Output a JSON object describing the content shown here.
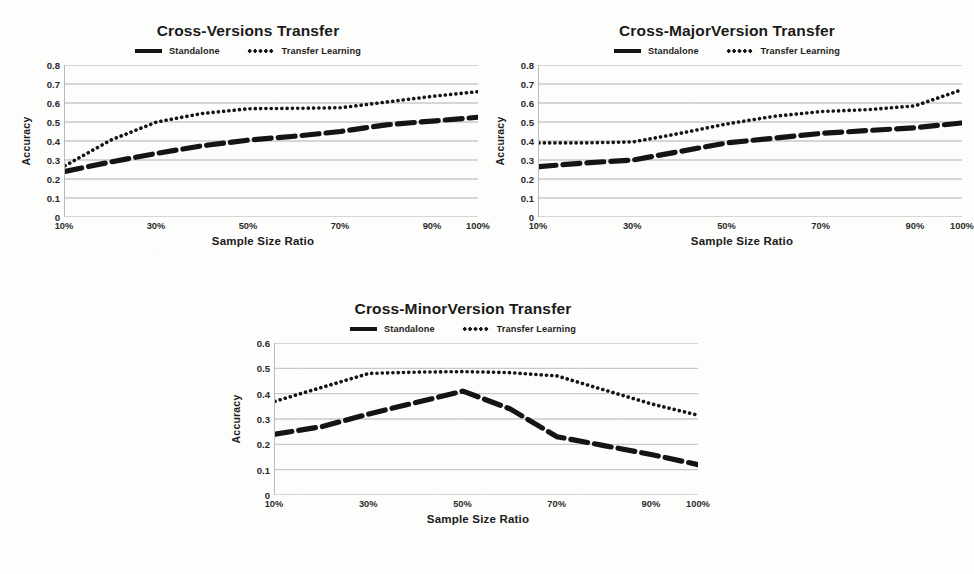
{
  "figure": {
    "background": "#fdfdfc",
    "ink": "#141414",
    "gridline_color": "#c9c9c9",
    "axis_color": "#b9b9b9"
  },
  "legend": {
    "standalone_label": "Standalone",
    "transfer_label": "Transfer Learning",
    "standalone_style": "solid-thick-line",
    "transfer_style": "dotted-line"
  },
  "axis": {
    "xlabel": "Sample Size Ratio",
    "ylabel": "Accuracy",
    "xticks": [
      "10%",
      "30%",
      "50%",
      "70%",
      "90%",
      "100%"
    ],
    "xtick_positions": [
      10,
      30,
      50,
      70,
      90,
      100
    ],
    "yticks_08": [
      "0",
      "0.1",
      "0.2",
      "0.3",
      "0.4",
      "0.5",
      "0.6",
      "0.7",
      "0.8"
    ],
    "yticks_06": [
      "0",
      "0.1",
      "0.2",
      "0.3",
      "0.4",
      "0.5",
      "0.6"
    ]
  },
  "chart_data": [
    {
      "type": "line",
      "id": "cross-versions",
      "title": "Cross-Versions Transfer",
      "xlabel": "Sample Size Ratio",
      "ylabel": "Accuracy",
      "ylim": [
        0,
        0.8
      ],
      "xlim": [
        10,
        100
      ],
      "grid": true,
      "legend_position": "top-center",
      "x": [
        10,
        20,
        30,
        40,
        50,
        60,
        70,
        80,
        90,
        100
      ],
      "series": [
        {
          "name": "Standalone",
          "style": "dashed-thick",
          "values": [
            0.24,
            0.29,
            0.335,
            0.375,
            0.405,
            0.425,
            0.45,
            0.485,
            0.505,
            0.525
          ]
        },
        {
          "name": "Transfer Learning",
          "style": "dotted",
          "values": [
            0.27,
            0.405,
            0.5,
            0.545,
            0.57,
            0.572,
            0.575,
            0.605,
            0.635,
            0.66
          ]
        }
      ]
    },
    {
      "type": "line",
      "id": "cross-majorversion",
      "title": "Cross-MajorVersion Transfer",
      "xlabel": "Sample Size Ratio",
      "ylabel": "Accuracy",
      "ylim": [
        0,
        0.8
      ],
      "xlim": [
        10,
        100
      ],
      "grid": true,
      "legend_position": "top-center",
      "x": [
        10,
        20,
        30,
        40,
        50,
        60,
        70,
        80,
        90,
        100
      ],
      "series": [
        {
          "name": "Standalone",
          "style": "dashed-thick",
          "values": [
            0.265,
            0.285,
            0.3,
            0.345,
            0.39,
            0.415,
            0.44,
            0.455,
            0.47,
            0.495
          ]
        },
        {
          "name": "Transfer Learning",
          "style": "dotted",
          "values": [
            0.39,
            0.39,
            0.395,
            0.44,
            0.49,
            0.53,
            0.555,
            0.565,
            0.585,
            0.67
          ]
        }
      ]
    },
    {
      "type": "line",
      "id": "cross-minorversion",
      "title": "Cross-MinorVersion Transfer",
      "xlabel": "Sample Size Ratio",
      "ylabel": "Accuracy",
      "ylim": [
        0,
        0.6
      ],
      "xlim": [
        10,
        100
      ],
      "grid": true,
      "legend_position": "top-center",
      "x": [
        10,
        20,
        30,
        40,
        50,
        60,
        70,
        80,
        90,
        100
      ],
      "series": [
        {
          "name": "Standalone",
          "style": "dashed-thick",
          "values": [
            0.24,
            0.27,
            0.32,
            0.365,
            0.41,
            0.34,
            0.23,
            0.195,
            0.16,
            0.12
          ]
        },
        {
          "name": "Transfer Learning",
          "style": "dotted",
          "values": [
            0.37,
            0.425,
            0.48,
            0.485,
            0.487,
            0.483,
            0.47,
            0.415,
            0.36,
            0.315
          ]
        }
      ]
    }
  ]
}
